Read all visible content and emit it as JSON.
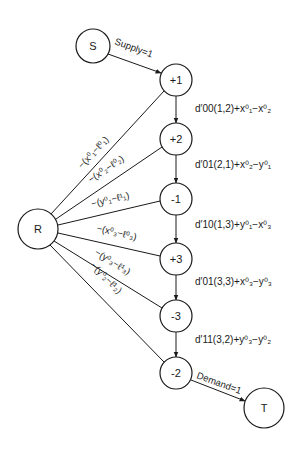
{
  "diagram": {
    "nodes": [
      {
        "id": "S",
        "label": "S",
        "x": 93,
        "y": 46,
        "r": 17
      },
      {
        "id": "n1",
        "label": "+1",
        "x": 176,
        "y": 80,
        "r": 16
      },
      {
        "id": "n2",
        "label": "+2",
        "x": 176,
        "y": 139,
        "r": 16
      },
      {
        "id": "n3",
        "label": "-1",
        "x": 176,
        "y": 199,
        "r": 16
      },
      {
        "id": "n4",
        "label": "+3",
        "x": 176,
        "y": 259,
        "r": 16
      },
      {
        "id": "n5",
        "label": "-3",
        "x": 176,
        "y": 316,
        "r": 16
      },
      {
        "id": "n6",
        "label": "-2",
        "x": 176,
        "y": 373,
        "r": 16
      },
      {
        "id": "R",
        "label": "R",
        "x": 38,
        "y": 229,
        "r": 20
      },
      {
        "id": "T",
        "label": "T",
        "x": 264,
        "y": 408,
        "r": 20
      }
    ],
    "supply_label": "Supply=1",
    "demand_label": "Demand=1",
    "chain_costs": [
      {
        "d": "d",
        "sup": "′",
        "sub": "00",
        "args": "(1,2)",
        "rest": "+x",
        "a_sup": "0",
        "a_sub": "1",
        "minus": "−x",
        "b_sup": "0",
        "b_sub": "2",
        "text": "d′00(1,2)+x⁰₁−x⁰₂"
      },
      {
        "d": "d",
        "sup": "′",
        "sub": "01",
        "args": "(2,1)",
        "rest": "+x",
        "a_sup": "0",
        "a_sub": "2",
        "minus": "−y",
        "b_sup": "0",
        "b_sub": "1",
        "text": "d′01(2,1)+x⁰₂−y⁰₁"
      },
      {
        "d": "d",
        "sup": "′",
        "sub": "10",
        "args": "(1,3)",
        "rest": "+y",
        "a_sup": "0",
        "a_sub": "1",
        "minus": "−x",
        "b_sup": "0",
        "b_sub": "3",
        "text": "d′10(1,3)+y⁰₁−x⁰₃"
      },
      {
        "d": "d",
        "sup": "′",
        "sub": "01",
        "args": "(3,3)",
        "rest": "+x",
        "a_sup": "0",
        "a_sub": "3",
        "minus": "−y",
        "b_sup": "0",
        "b_sub": "3",
        "text": "d′01(3,3)+x⁰₃−y⁰₃"
      },
      {
        "d": "d",
        "sup": "′",
        "sub": "11",
        "args": "(3,2)",
        "rest": "+y",
        "a_sup": "0",
        "a_sub": "3",
        "minus": "−y",
        "b_sup": "0",
        "b_sub": "2",
        "text": "d′11(3,2)+y⁰₃−y⁰₂"
      }
    ],
    "r_edges": [
      {
        "to": "+1",
        "label": "−(x⁰₁−ℓ⁰₁)"
      },
      {
        "to": "+2",
        "label": "−(x⁰₂−ℓ⁰₂)"
      },
      {
        "to": "-1",
        "label": "−(y⁰₁−ℓ¹₁)"
      },
      {
        "to": "+3",
        "label": "−(x⁰₃−ℓ⁰₃)"
      },
      {
        "to": "-3",
        "label": "−(y⁰₃−ℓ¹₃)"
      },
      {
        "to": "-2",
        "label": "−(y⁰₂−ℓ¹₂)"
      }
    ]
  }
}
